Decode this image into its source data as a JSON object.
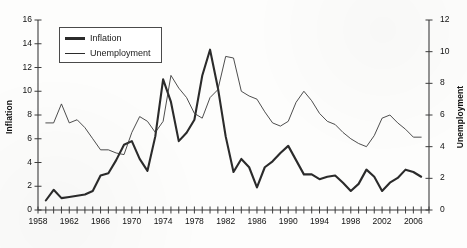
{
  "chart_data": {
    "type": "line",
    "title": "",
    "subtitle": "",
    "xlabel": "",
    "grid": false,
    "legend_position": "top-left",
    "x_axis": {
      "label": "",
      "min": 1958,
      "max": 2008,
      "tick_step": 1,
      "label_step": 4,
      "tick_labels": [
        "1958",
        "1962",
        "1966",
        "1970",
        "1974",
        "1978",
        "1982",
        "1986",
        "1990",
        "1994",
        "1998",
        "2002",
        "2006"
      ]
    },
    "y_axis_left": {
      "label": "Inflation",
      "min": 0,
      "max": 16,
      "step": 2,
      "tick_labels": [
        "0",
        "2",
        "4",
        "6",
        "8",
        "10",
        "12",
        "14",
        "16"
      ]
    },
    "y_axis_right": {
      "label": "Unemployment",
      "min": 0,
      "max": 12,
      "step": 2,
      "tick_labels": [
        "0",
        "2",
        "4",
        "6",
        "8",
        "10",
        "12"
      ]
    },
    "x": [
      1959,
      1960,
      1961,
      1962,
      1963,
      1964,
      1965,
      1966,
      1967,
      1968,
      1969,
      1970,
      1971,
      1972,
      1973,
      1974,
      1975,
      1976,
      1977,
      1978,
      1979,
      1980,
      1981,
      1982,
      1983,
      1984,
      1985,
      1986,
      1987,
      1988,
      1989,
      1990,
      1991,
      1992,
      1993,
      1994,
      1995,
      1996,
      1997,
      1998,
      1999,
      2000,
      2001,
      2002,
      2003,
      2004,
      2005,
      2006,
      2007
    ],
    "series": [
      {
        "name": "Inflation",
        "axis": "left",
        "color": "#2b2b2b",
        "line_width": 2.1,
        "values": [
          0.8,
          1.7,
          1.0,
          1.1,
          1.2,
          1.3,
          1.6,
          2.9,
          3.1,
          4.2,
          5.5,
          5.8,
          4.3,
          3.3,
          6.2,
          11.0,
          9.1,
          5.8,
          6.5,
          7.6,
          11.3,
          13.5,
          10.3,
          6.2,
          3.2,
          4.3,
          3.6,
          1.9,
          3.6,
          4.1,
          4.8,
          5.4,
          4.2,
          3.0,
          3.0,
          2.6,
          2.8,
          2.9,
          2.3,
          1.6,
          2.2,
          3.4,
          2.8,
          1.6,
          2.3,
          2.7,
          3.4,
          3.2,
          2.8
        ]
      },
      {
        "name": "Unemployment",
        "axis": "right",
        "color": "#3a3a3a",
        "line_width": 0.9,
        "values": [
          5.5,
          5.5,
          6.7,
          5.5,
          5.7,
          5.2,
          4.5,
          3.8,
          3.8,
          3.6,
          3.5,
          4.9,
          5.9,
          5.6,
          4.9,
          5.6,
          8.5,
          7.7,
          7.1,
          6.1,
          5.8,
          7.1,
          7.6,
          9.7,
          9.6,
          7.5,
          7.2,
          7.0,
          6.2,
          5.5,
          5.3,
          5.6,
          6.8,
          7.5,
          6.9,
          6.1,
          5.6,
          5.4,
          4.9,
          4.5,
          4.2,
          4.0,
          4.7,
          5.8,
          6.0,
          5.5,
          5.1,
          4.6,
          4.6
        ]
      }
    ],
    "legend": [
      {
        "label": "Inflation",
        "style": "thick"
      },
      {
        "label": "Unemployment",
        "style": "thin"
      }
    ]
  }
}
